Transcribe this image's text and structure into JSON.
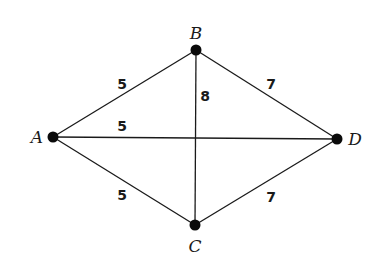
{
  "diagram": {
    "type": "weighted-graph",
    "nodes": [
      {
        "id": "A",
        "label": "A",
        "x": 53,
        "y": 137,
        "label_x": 37,
        "label_y": 143
      },
      {
        "id": "B",
        "label": "B",
        "x": 196,
        "y": 50,
        "label_x": 196,
        "label_y": 39
      },
      {
        "id": "C",
        "label": "C",
        "x": 195,
        "y": 225,
        "label_x": 195,
        "label_y": 252
      },
      {
        "id": "D",
        "label": "D",
        "x": 337,
        "y": 139,
        "label_x": 355,
        "label_y": 145
      }
    ],
    "edges": [
      {
        "from": "A",
        "to": "B",
        "weight": "5",
        "label_x": 122,
        "label_y": 89
      },
      {
        "from": "A",
        "to": "D",
        "weight": "5",
        "label_x": 122,
        "label_y": 131
      },
      {
        "from": "A",
        "to": "C",
        "weight": "5",
        "label_x": 122,
        "label_y": 200
      },
      {
        "from": "B",
        "to": "C",
        "weight": "8",
        "label_x": 205,
        "label_y": 101
      },
      {
        "from": "B",
        "to": "D",
        "weight": "7",
        "label_x": 271,
        "label_y": 89
      },
      {
        "from": "C",
        "to": "D",
        "weight": "7",
        "label_x": 271,
        "label_y": 202
      }
    ],
    "colors": {
      "line": "#1a1a1a",
      "node": "#0a0a0a",
      "background": "#ffffff"
    }
  }
}
